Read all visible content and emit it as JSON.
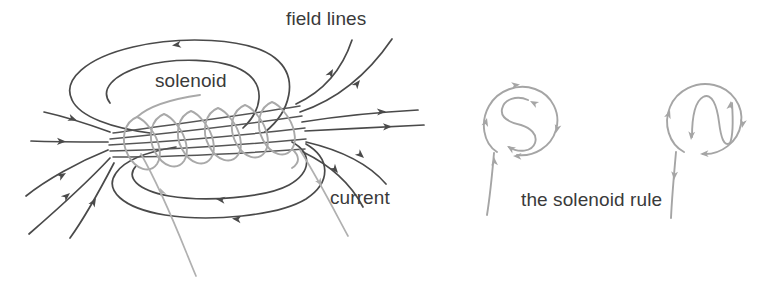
{
  "figure": {
    "background_color": "#ffffff",
    "width": 768,
    "height": 282
  },
  "labels": {
    "field_lines": "field lines",
    "solenoid": "solenoid",
    "current": "current",
    "solenoid_rule": "the solenoid rule"
  },
  "colors": {
    "field_line": "#4a4a4a",
    "coil": "#a9a9a9",
    "leader": "#b0b0b0",
    "rule_stroke": "#a5a5a5",
    "text": "#3a3a3a",
    "background": "#ffffff"
  },
  "left_diagram": {
    "name": "solenoid-field-diagram",
    "coil_turns": 6,
    "coil_color": "#a9a9a9",
    "field_line_color": "#4a4a4a",
    "axis_direction": "left-to-right",
    "field_direction_inside": "rightward through coil axis",
    "field_direction_return_loops": "leftward around outside",
    "leader_lines": 2,
    "leader_targets": [
      "coil winding",
      "current path"
    ]
  },
  "right_diagram": {
    "name": "solenoid-rule-diagram",
    "caption": "the solenoid rule",
    "circles": [
      {
        "glyph": "S",
        "pole": "south",
        "current_sense": "clockwise",
        "tail_direction": "upward",
        "arrow_count": 4
      },
      {
        "glyph": "N",
        "pole": "north",
        "current_sense": "counterclockwise",
        "tail_direction": "downward",
        "arrow_count": 4
      }
    ]
  }
}
